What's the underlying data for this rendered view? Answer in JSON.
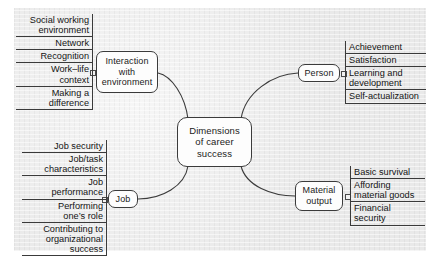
{
  "diagram": {
    "title": "Dimensions of career success",
    "type": "mind-map",
    "background_color": "#e9e9e9",
    "node_fill": "#fdfdfd",
    "line_color": "#3b3b3b",
    "hub": {
      "label": "Dimensions\nof career\nsuccess"
    },
    "branches": [
      {
        "id": "interaction",
        "label": "Interaction\nwith\nenvironment",
        "leaf_header": "Social working\nenvironment",
        "leaves": [
          "Network",
          "Recognition",
          "Work–life\ncontext",
          "Making a\ndifference"
        ],
        "side": "left"
      },
      {
        "id": "person",
        "label": "Person",
        "leaf_header": "Achievement",
        "leaves": [
          "Satisfaction",
          "Learning and\ndevelopment",
          "Self-actualization"
        ],
        "side": "right"
      },
      {
        "id": "job",
        "label": "Job",
        "leaf_header": "Job security",
        "leaves": [
          "Job/task\ncharacteristics",
          "Job\nperformance",
          "Performing\none’s role",
          "Contributing to\norganizational\nsuccess"
        ],
        "side": "left"
      },
      {
        "id": "material",
        "label": "Material\noutput",
        "leaf_header": "Basic survival",
        "leaves": [
          "Affording\nmaterial goods",
          "Financial\nsecurity"
        ],
        "side": "right"
      }
    ]
  }
}
